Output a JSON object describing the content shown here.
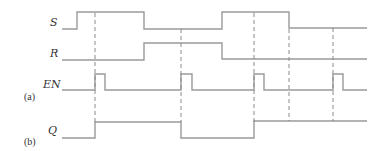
{
  "diagram": {
    "type": "timing-diagram",
    "signals": [
      {
        "name": "S",
        "label": "S"
      },
      {
        "name": "R",
        "label": "R"
      },
      {
        "name": "EN",
        "label": "EN"
      },
      {
        "name": "Q",
        "label": "Q"
      }
    ],
    "part_labels": {
      "a": "(a)",
      "b": "(b)"
    },
    "sequence": {
      "S": [
        0,
        1,
        0,
        1,
        0
      ],
      "R": [
        0,
        1,
        0
      ],
      "EN_pulses": 4,
      "Q": [
        0,
        1,
        0,
        1
      ]
    },
    "line_color": "#9a9a9a"
  }
}
